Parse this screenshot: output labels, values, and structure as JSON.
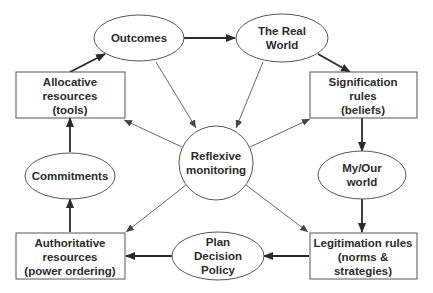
{
  "diagram": {
    "nodes": {
      "outcomes": {
        "lines": [
          "Outcomes"
        ],
        "shape": "ellipse"
      },
      "real_world": {
        "lines": [
          "The Real",
          "World"
        ],
        "shape": "ellipse"
      },
      "allocative": {
        "lines": [
          "Allocative",
          "resources",
          "(tools)"
        ],
        "shape": "box"
      },
      "signification": {
        "lines": [
          "Signification",
          "rules",
          "(beliefs)"
        ],
        "shape": "box"
      },
      "reflexive": {
        "lines": [
          "Reflexive",
          "monitoring"
        ],
        "shape": "circle"
      },
      "commitments": {
        "lines": [
          "Commitments"
        ],
        "shape": "ellipse"
      },
      "my_our_world": {
        "lines": [
          "My/Our",
          "world"
        ],
        "shape": "ellipse"
      },
      "authoritative": {
        "lines": [
          "Authoritative",
          "resources",
          "(power ordering)"
        ],
        "shape": "box"
      },
      "plan": {
        "lines": [
          "Plan",
          "Decision",
          "Policy"
        ],
        "shape": "ellipse"
      },
      "legitimation": {
        "lines": [
          "Legitimation rules",
          "(norms &",
          "strategies)"
        ],
        "shape": "box"
      }
    },
    "edges": [
      {
        "from": "outcomes",
        "to": "real_world",
        "style": "thick"
      },
      {
        "from": "real_world",
        "to": "signification",
        "style": "thick"
      },
      {
        "from": "signification",
        "to": "my_our_world",
        "style": "thick"
      },
      {
        "from": "my_our_world",
        "to": "legitimation",
        "style": "thick"
      },
      {
        "from": "legitimation",
        "to": "plan",
        "style": "thick"
      },
      {
        "from": "plan",
        "to": "authoritative",
        "style": "thick"
      },
      {
        "from": "authoritative",
        "to": "commitments",
        "style": "thick"
      },
      {
        "from": "commitments",
        "to": "allocative",
        "style": "thick"
      },
      {
        "from": "allocative",
        "to": "outcomes",
        "style": "thick"
      },
      {
        "from": "outcomes",
        "to": "reflexive",
        "style": "thin"
      },
      {
        "from": "real_world",
        "to": "reflexive",
        "style": "thin"
      },
      {
        "from": "reflexive",
        "to": "allocative",
        "style": "thin"
      },
      {
        "from": "reflexive",
        "to": "signification",
        "style": "thin"
      },
      {
        "from": "reflexive",
        "to": "authoritative",
        "style": "thin"
      },
      {
        "from": "reflexive",
        "to": "legitimation",
        "style": "thin"
      }
    ]
  }
}
